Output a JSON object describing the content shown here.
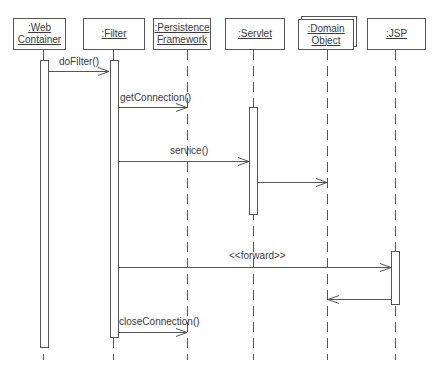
{
  "diagram": {
    "type": "uml-sequence",
    "participants": [
      {
        "id": "web",
        "label_line1": ":Web",
        "label_line2": "Container"
      },
      {
        "id": "filter",
        "label_line1": ":Filter",
        "label_line2": ""
      },
      {
        "id": "persist",
        "label_line1": ":Persistence",
        "label_line2": "Framework"
      },
      {
        "id": "servlet",
        "label_line1": ":Servlet",
        "label_line2": ""
      },
      {
        "id": "domain",
        "label_line1": ":Domain",
        "label_line2": "Object",
        "multi_object": true
      },
      {
        "id": "jsp",
        "label_line1": ":JSP",
        "label_line2": ""
      }
    ],
    "messages": [
      {
        "from": "web",
        "to": "filter",
        "label": "doFilter()"
      },
      {
        "from": "filter",
        "to": "persist",
        "label": "getConnection()"
      },
      {
        "from": "filter",
        "to": "servlet",
        "label": "service()"
      },
      {
        "from": "servlet",
        "to": "domain",
        "label": ""
      },
      {
        "from": "filter",
        "to": "jsp",
        "label": "<<forward>>"
      },
      {
        "from": "jsp",
        "to": "domain",
        "label": ""
      },
      {
        "from": "filter",
        "to": "persist",
        "label": "closeConnection()"
      }
    ],
    "line_color": "#555555"
  }
}
